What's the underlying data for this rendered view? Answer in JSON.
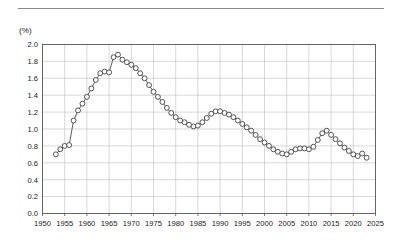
{
  "figure": {
    "unit_label": "(%)",
    "has_top_rule": true
  },
  "chart_data": {
    "type": "line",
    "title": "",
    "subtitle": "",
    "xlabel": "",
    "ylabel": "(%)",
    "unit": "%",
    "grid": true,
    "legend": false,
    "legend_position": "none",
    "marker": "open-circle",
    "line_color": "#5d5d5d",
    "marker_fill": "#ffffff",
    "marker_edge": "#4a4a4a",
    "xlim": [
      1950,
      2025
    ],
    "ylim": [
      0.0,
      2.0
    ],
    "ytick_step": 0.2,
    "xtick_step": 5,
    "xticks": [
      1950,
      1955,
      1960,
      1965,
      1970,
      1975,
      1980,
      1985,
      1990,
      1995,
      2000,
      2005,
      2010,
      2015,
      2020,
      2025
    ],
    "xtick_labels": [
      "1950",
      "1955",
      "1960",
      "1965",
      "1970",
      "1975",
      "1980",
      "1985",
      "1990",
      "1995",
      "2000",
      "2005",
      "2010",
      "2015",
      "2020",
      "2025"
    ],
    "yticks": [
      0.0,
      0.2,
      0.4,
      0.6,
      0.8,
      1.0,
      1.2,
      1.4,
      1.6,
      1.8,
      2.0
    ],
    "ytick_labels": [
      "0.0",
      "0.2",
      "0.4",
      "0.6",
      "0.8",
      "1.0",
      "1.2",
      "1.4",
      "1.6",
      "1.8",
      "2.0"
    ],
    "x": [
      1953,
      1954,
      1955,
      1956,
      1957,
      1958,
      1959,
      1960,
      1961,
      1962,
      1963,
      1964,
      1965,
      1966,
      1967,
      1968,
      1969,
      1970,
      1971,
      1972,
      1973,
      1974,
      1975,
      1976,
      1977,
      1978,
      1979,
      1980,
      1981,
      1982,
      1983,
      1984,
      1985,
      1986,
      1987,
      1988,
      1989,
      1990,
      1991,
      1992,
      1993,
      1994,
      1995,
      1996,
      1997,
      1998,
      1999,
      2000,
      2001,
      2002,
      2003,
      2004,
      2005,
      2006,
      2007,
      2008,
      2009,
      2010,
      2011,
      2012,
      2013,
      2014,
      2015,
      2016,
      2017,
      2018,
      2019,
      2020,
      2021,
      2022,
      2023
    ],
    "y": [
      0.7,
      0.76,
      0.8,
      0.81,
      1.1,
      1.22,
      1.3,
      1.38,
      1.48,
      1.58,
      1.66,
      1.68,
      1.67,
      1.85,
      1.88,
      1.82,
      1.79,
      1.76,
      1.72,
      1.66,
      1.6,
      1.52,
      1.44,
      1.38,
      1.32,
      1.25,
      1.19,
      1.14,
      1.1,
      1.08,
      1.05,
      1.03,
      1.04,
      1.08,
      1.13,
      1.18,
      1.21,
      1.21,
      1.19,
      1.17,
      1.14,
      1.1,
      1.06,
      1.02,
      0.98,
      0.93,
      0.88,
      0.84,
      0.8,
      0.76,
      0.73,
      0.71,
      0.7,
      0.73,
      0.76,
      0.77,
      0.77,
      0.76,
      0.79,
      0.87,
      0.95,
      0.98,
      0.93,
      0.88,
      0.83,
      0.78,
      0.74,
      0.7,
      0.68,
      0.71,
      0.66
    ],
    "series": [
      {
        "name": "series-1",
        "values": [
          0.7,
          0.76,
          0.8,
          0.81,
          1.1,
          1.22,
          1.3,
          1.38,
          1.48,
          1.58,
          1.66,
          1.68,
          1.67,
          1.85,
          1.88,
          1.82,
          1.79,
          1.76,
          1.72,
          1.66,
          1.6,
          1.52,
          1.44,
          1.38,
          1.32,
          1.25,
          1.19,
          1.14,
          1.1,
          1.08,
          1.05,
          1.03,
          1.04,
          1.08,
          1.13,
          1.18,
          1.21,
          1.21,
          1.19,
          1.17,
          1.14,
          1.1,
          1.06,
          1.02,
          0.98,
          0.93,
          0.88,
          0.84,
          0.8,
          0.76,
          0.73,
          0.71,
          0.7,
          0.73,
          0.76,
          0.77,
          0.77,
          0.76,
          0.79,
          0.87,
          0.95,
          0.98,
          0.93,
          0.88,
          0.83,
          0.78,
          0.74,
          0.7,
          0.68,
          0.71,
          0.66
        ]
      }
    ],
    "annotations": [],
    "notes": {
      "peak_value": 1.88,
      "peak_year": 1967,
      "min_value": 0.66,
      "min_year": 2023,
      "start_value": 0.7,
      "start_year": 1953,
      "end_value": 0.66,
      "end_year": 2023
    }
  }
}
